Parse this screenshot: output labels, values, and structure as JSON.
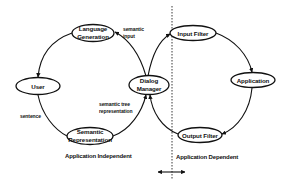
{
  "diagram": {
    "nodes": {
      "language_generation": {
        "line1": "Language",
        "line2": "Generation"
      },
      "user": {
        "label": "User"
      },
      "dialog_manager": {
        "line1": "Dialog",
        "line2": "Manager"
      },
      "semantic_representation": {
        "line1": "Semantic",
        "line2": "Representation"
      },
      "input_filter": {
        "label": "Input Filter"
      },
      "application": {
        "label": "Application"
      },
      "output_filter": {
        "label": "Output Filter"
      }
    },
    "edge_labels": {
      "semantic_input": {
        "line1": "semantic",
        "line2": "input"
      },
      "semantic_tree": {
        "line1": "semantic tree",
        "line2": "representation"
      },
      "sentence": "sentence"
    },
    "regions": {
      "left": "Application Independent",
      "right": "Application Dependent"
    },
    "colors": {
      "stroke": "#111111",
      "background": "#ffffff"
    }
  }
}
